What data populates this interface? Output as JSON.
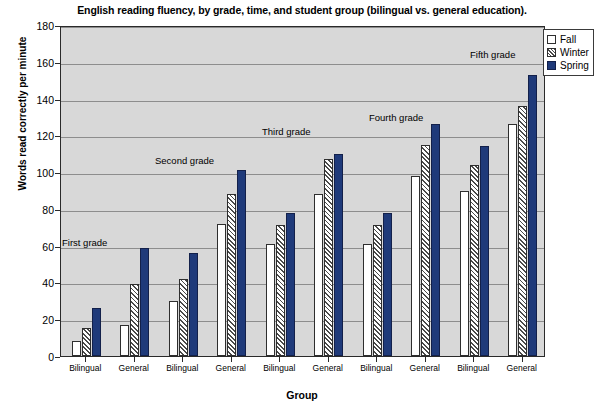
{
  "chart_data": {
    "type": "bar",
    "title": "English reading fluency, by grade, time, and student group (bilingual vs. general education).",
    "xlabel": "Group",
    "ylabel": "Words read correctly per minute",
    "ylim": [
      0,
      180
    ],
    "ytick_labels": [
      "0",
      "20",
      "40",
      "60",
      "80",
      "100",
      "120",
      "140",
      "160",
      "180"
    ],
    "yticks": [
      0,
      20,
      40,
      60,
      80,
      100,
      120,
      140,
      160,
      180
    ],
    "grid": true,
    "legend_position": "top-right",
    "categories": [
      "Bilingual",
      "General",
      "Bilingual",
      "General",
      "Bilingual",
      "General",
      "Bilingual",
      "General",
      "Bilingual",
      "General"
    ],
    "group_annotations": [
      "First grade",
      "Second grade",
      "Third grade",
      "Fourth grade",
      "Fifth grade"
    ],
    "series": [
      {
        "name": "Fall",
        "color": "#ffffff",
        "values": [
          8,
          17,
          30,
          72,
          61,
          88,
          61,
          98,
          90,
          126
        ]
      },
      {
        "name": "Winter",
        "color": "#cccccc",
        "values": [
          15,
          39,
          42,
          88,
          71,
          107,
          71,
          115,
          104,
          136
        ]
      },
      {
        "name": "Spring",
        "color": "#1f3a7a",
        "values": [
          26,
          59,
          56,
          101,
          78,
          110,
          78,
          126,
          114,
          153
        ]
      }
    ]
  },
  "legend": {
    "items": [
      {
        "label": "Fall",
        "key": "fall"
      },
      {
        "label": "Winter",
        "key": "winter"
      },
      {
        "label": "Spring",
        "key": "spring"
      }
    ]
  }
}
